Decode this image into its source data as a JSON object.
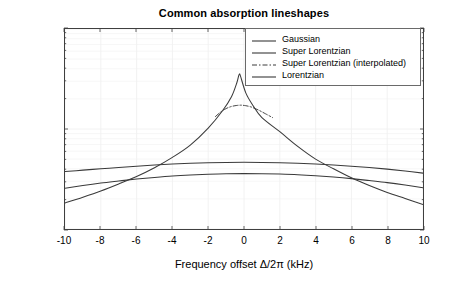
{
  "chart_data": {
    "type": "line",
    "title": "Common absorption lineshapes",
    "xlabel": "Frequency offset Δ/2π (kHz)",
    "ylabel": "Lineshape value G(Δ) (s)",
    "xscale": "linear",
    "yscale": "log",
    "xlim": [
      -10,
      10
    ],
    "ylim": [
      1e-06,
      0.0001
    ],
    "grid": true,
    "grid_color": "#f0f0f0",
    "legend_position": "top right",
    "xticks": [
      -10,
      -8,
      -6,
      -4,
      -2,
      0,
      2,
      4,
      6,
      8,
      10
    ],
    "xtick_labels": [
      "-10",
      "-8",
      "-6",
      "-4",
      "-2",
      "0",
      "2",
      "4",
      "6",
      "8",
      "10"
    ],
    "yticks": [
      1e-06,
      1e-05,
      0.0001
    ],
    "ytick_labels": [
      "10",
      "10",
      "10"
    ],
    "ytick_exponents": [
      "-6",
      "-5",
      "-4"
    ],
    "series": [
      {
        "name": "Gaussian",
        "style": "solid",
        "color": "#3a3a3a",
        "x": [
          -10,
          -9,
          -8,
          -7,
          -6,
          -5,
          -4,
          -3,
          -2,
          -1,
          0,
          1,
          2,
          3,
          4,
          5,
          6,
          7,
          8,
          9,
          10
        ],
        "y": [
          2.55e-06,
          2.72e-06,
          2.88e-06,
          3.02e-06,
          3.16e-06,
          3.28e-06,
          3.39e-06,
          3.47e-06,
          3.53e-06,
          3.57e-06,
          3.58e-06,
          3.57e-06,
          3.54e-06,
          3.49e-06,
          3.41e-06,
          3.31e-06,
          3.19e-06,
          3.05e-06,
          2.91e-06,
          2.75e-06,
          2.58e-06
        ]
      },
      {
        "name": "Super Lorentzian",
        "style": "solid",
        "color": "#3a3a3a",
        "x": [
          -10,
          -9,
          -8,
          -7,
          -6,
          -5,
          -4,
          -3,
          -2,
          -1.2,
          -0.7,
          -0.4,
          -0.3,
          -0.25,
          -0.2,
          0.1,
          0.5,
          1,
          2,
          3,
          4,
          5,
          6,
          7,
          8,
          9,
          10
        ],
        "y": [
          1.82e-06,
          2.08e-06,
          2.4e-06,
          2.82e-06,
          3.35e-06,
          4.1e-06,
          5.2e-06,
          6.9e-06,
          1.02e-05,
          1.52e-05,
          2.1e-05,
          2.9e-05,
          3.4e-05,
          3.55e-05,
          3.4e-05,
          2.3e-05,
          1.72e-05,
          1.3e-05,
          9.4e-06,
          6.7e-06,
          5e-06,
          4e-06,
          3.25e-06,
          2.72e-06,
          2.32e-06,
          2.02e-06,
          1.76e-06
        ]
      },
      {
        "name": "Super Lorentzian (interpolated)",
        "style": "dash-dot",
        "color": "#3a3a3a",
        "x": [
          -1.6,
          -1.3,
          -1.0,
          -0.7,
          -0.4,
          -0.15,
          0.1,
          0.4,
          0.8,
          1.2,
          1.6
        ],
        "y": [
          1.33e-05,
          1.48e-05,
          1.6e-05,
          1.68e-05,
          1.72e-05,
          1.73e-05,
          1.71e-05,
          1.66e-05,
          1.55e-05,
          1.42e-05,
          1.3e-05
        ]
      },
      {
        "name": "Lorentzian",
        "style": "solid",
        "color": "#3a3a3a",
        "x": [
          -10,
          -9,
          -8,
          -7,
          -6,
          -5,
          -4,
          -3,
          -2,
          -1,
          0,
          1,
          2,
          3,
          4,
          5,
          6,
          7,
          8,
          9,
          10
        ],
        "y": [
          3.75e-06,
          3.88e-06,
          4e-06,
          4.13e-06,
          4.25e-06,
          4.36e-06,
          4.46e-06,
          4.54e-06,
          4.6e-06,
          4.63e-06,
          4.64e-06,
          4.63e-06,
          4.6e-06,
          4.55e-06,
          4.47e-06,
          4.37e-06,
          4.25e-06,
          4.12e-06,
          3.97e-06,
          3.8e-06,
          3.62e-06
        ]
      }
    ]
  },
  "legend": {
    "items": [
      {
        "label": "Gaussian",
        "style": "solid"
      },
      {
        "label": "Super Lorentzian",
        "style": "solid"
      },
      {
        "label": "Super Lorentzian (interpolated)",
        "style": "dash-dot"
      },
      {
        "label": "Lorentzian",
        "style": "solid"
      }
    ]
  }
}
